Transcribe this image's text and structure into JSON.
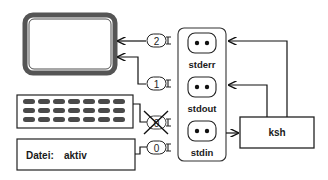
{
  "diagram": {
    "title": "",
    "devices": {
      "monitor": {
        "label": ""
      },
      "keyboard": {
        "rows": 3,
        "keys_per_row": 7
      },
      "file": {
        "label": "Datei:",
        "value": "aktiv"
      }
    },
    "plugs": [
      {
        "id": "plug-2",
        "number": "2",
        "crossed": false
      },
      {
        "id": "plug-1",
        "number": "1",
        "crossed": false
      },
      {
        "id": "plug-keyboard",
        "number": "0",
        "crossed": true
      },
      {
        "id": "plug-0",
        "number": "0",
        "crossed": false
      }
    ],
    "sockets": [
      {
        "name": "stderr"
      },
      {
        "name": "stdout"
      },
      {
        "name": "stdin"
      }
    ],
    "process": {
      "label": "ksh"
    },
    "colors": {
      "line": "#111111",
      "monitor_border": "#555555",
      "key_fill": "#4a4a4a",
      "box_border": "#222222"
    }
  }
}
